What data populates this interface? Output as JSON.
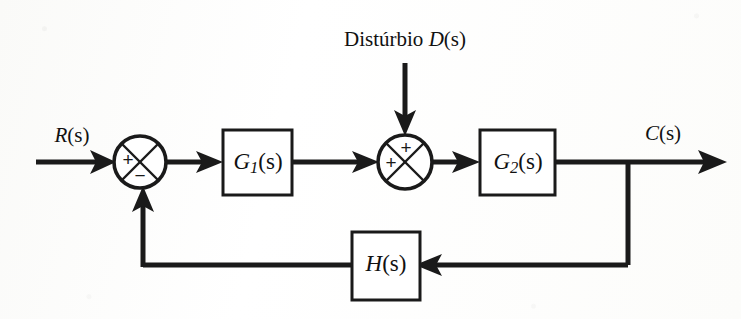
{
  "figure": {
    "type": "control-system-block-diagram",
    "language": "pt-BR",
    "background_color": "#fdfdfc",
    "line_color": "#1a1a1a"
  },
  "labels": {
    "disturbance_caption": "Distúrbio",
    "disturbance_symbol_var": "D",
    "disturbance_symbol_arg": "(s)",
    "input_var": "R",
    "input_arg": "(s)",
    "output_var": "C",
    "output_arg": "(s)"
  },
  "blocks": [
    {
      "id": "g1",
      "name": "plant-block-g1",
      "var": "G",
      "subscript": "1",
      "arg": "(s)",
      "x": 223,
      "y": 130,
      "width": 69,
      "height": 65
    },
    {
      "id": "g2",
      "name": "plant-block-g2",
      "var": "G",
      "subscript": "2",
      "arg": "(s)",
      "x": 480,
      "y": 130,
      "width": 75,
      "height": 65
    },
    {
      "id": "h",
      "name": "feedback-block-h",
      "var": "H",
      "subscript": "",
      "arg": "(s)",
      "x": 352,
      "y": 232,
      "width": 68,
      "height": 68
    }
  ],
  "summing_junctions": [
    {
      "id": "sum1",
      "name": "summing-junction-error",
      "cx": 140,
      "cy": 162,
      "r": 26,
      "signs": [
        {
          "label": "+",
          "position": "left",
          "dx": -12,
          "dy": -1
        },
        {
          "label": "−",
          "position": "bottom",
          "dx": 0,
          "dy": 14
        }
      ]
    },
    {
      "id": "sum2",
      "name": "summing-junction-disturbance",
      "cx": 405,
      "cy": 162,
      "r": 27,
      "signs": [
        {
          "label": "+",
          "position": "top",
          "dx": 1,
          "dy": -13
        },
        {
          "label": "+",
          "position": "left",
          "dx": -14,
          "dy": 2
        }
      ]
    }
  ],
  "signal_labels": [
    {
      "id": "r",
      "name": "input-signal-label",
      "x": 72,
      "y": 137
    },
    {
      "id": "c",
      "name": "output-signal-label",
      "x": 663,
      "y": 135
    },
    {
      "id": "d",
      "name": "disturbance-label",
      "x": 405,
      "y": 41
    }
  ],
  "geometry": {
    "main_line_y": 162,
    "feedback_line_y": 265,
    "input_x_start": 36,
    "output_x_end": 727,
    "takeoff_x": 628,
    "feedback_up_x": 143,
    "disturbance_x": 405,
    "disturbance_y_start": 63
  },
  "wires": [
    {
      "id": "w-input",
      "name": "wire-input-to-sum1",
      "from": "R(s)",
      "to": "sum1"
    },
    {
      "id": "w-sum1-g1",
      "name": "wire-sum1-to-g1",
      "from": "sum1",
      "to": "G1(s)"
    },
    {
      "id": "w-g1-sum2",
      "name": "wire-g1-to-sum2",
      "from": "G1(s)",
      "to": "sum2"
    },
    {
      "id": "w-dist",
      "name": "wire-disturbance-to-sum2",
      "from": "D(s)",
      "to": "sum2"
    },
    {
      "id": "w-sum2-g2",
      "name": "wire-sum2-to-g2",
      "from": "sum2",
      "to": "G2(s)"
    },
    {
      "id": "w-g2-out",
      "name": "wire-g2-to-output",
      "from": "G2(s)",
      "to": "C(s)"
    },
    {
      "id": "w-takeoff",
      "name": "wire-takeoff-to-h",
      "from": "C(s)",
      "to": "H(s)"
    },
    {
      "id": "w-h-sum1",
      "name": "wire-h-to-sum1",
      "from": "H(s)",
      "to": "sum1"
    }
  ]
}
